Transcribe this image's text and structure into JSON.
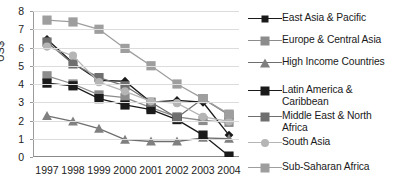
{
  "chart_data": {
    "type": "line",
    "title": "",
    "xlabel": "",
    "ylabel": "US$",
    "ylim": [
      0,
      8
    ],
    "ytick_labels": [
      "8",
      "7",
      "6",
      "5",
      "4",
      "3",
      "2",
      "1",
      "0"
    ],
    "ytick_values": [
      8,
      7,
      6,
      5,
      4,
      3,
      2,
      1,
      0
    ],
    "grid": true,
    "legend_position": "right",
    "categories": [
      "1997",
      "1998",
      "1999",
      "2000",
      "2001",
      "2002",
      "2003",
      "2004"
    ],
    "series": [
      {
        "name": "East Asia & Pacific",
        "marker": "diamond",
        "color": "#1a1a1a",
        "line_color": "#1a1a1a",
        "values": [
          6.45,
          5.15,
          4.2,
          4.15,
          3.0,
          3.1,
          3.0,
          1.2
        ]
      },
      {
        "name": "Europe & Central Asia",
        "marker": "square",
        "color": "#8c8c8c",
        "line_color": "#8c8c8c",
        "values": [
          4.45,
          4.0,
          3.4,
          3.25,
          2.7,
          2.2,
          2.0,
          1.9
        ]
      },
      {
        "name": "High Income Countries",
        "marker": "triangle",
        "color": "#808080",
        "line_color": "#6e6e6e",
        "values": [
          2.25,
          1.95,
          1.55,
          0.95,
          0.85,
          0.85,
          1.05,
          1.0
        ]
      },
      {
        "name": "Latin America & Caribbean",
        "marker": "square",
        "color": "#1a1a1a",
        "line_color": "#1a1a1a",
        "values": [
          4.05,
          3.9,
          3.2,
          2.85,
          2.6,
          2.05,
          1.2,
          0.05
        ]
      },
      {
        "name": "Middle East & North Africa",
        "marker": "square",
        "color": "#6f6f6f",
        "line_color": "#6f6f6f",
        "values": [
          6.3,
          5.1,
          4.35,
          3.9,
          3.0,
          2.15,
          3.2,
          2.3
        ]
      },
      {
        "name": "South Asia",
        "marker": "circle",
        "color": "#b5b5b5",
        "line_color": "#b5b5b5",
        "values": [
          6.05,
          5.55,
          4.1,
          3.6,
          3.05,
          2.95,
          2.2,
          1.95
        ]
      },
      {
        "name": "Sub-Saharan Africa",
        "marker": "square",
        "color": "#9e9e9e",
        "line_color": "#9e9e9e",
        "values": [
          7.5,
          7.4,
          7.0,
          5.95,
          5.0,
          4.0,
          3.2,
          2.35
        ]
      }
    ]
  },
  "axis": {
    "y_title": "US$",
    "y_labels": [
      "8",
      "7",
      "6",
      "5",
      "4",
      "3",
      "2",
      "1",
      "0"
    ],
    "x_labels": [
      "1997",
      "1998",
      "1999",
      "2000",
      "2001",
      "2002",
      "2003",
      "2004"
    ]
  },
  "legend": {
    "items": [
      {
        "label": "East Asia & Pacific",
        "marker": "diamond-marker",
        "color": "#1a1a1a",
        "line": "#1a1a1a"
      },
      {
        "label": "Europe & Central Asia",
        "marker": "square-marker",
        "color": "#8c8c8c",
        "line": "#8c8c8c"
      },
      {
        "label": "High Income Countries",
        "marker": "triangle-marker",
        "color": "#808080",
        "line": "#6e6e6e"
      },
      {
        "label": "Latin America &\nCaribbean",
        "marker": "square-marker",
        "color": "#1a1a1a",
        "line": "#1a1a1a"
      },
      {
        "label": "Middle East & North\nAfrica",
        "marker": "square-marker",
        "color": "#6f6f6f",
        "line": "#6f6f6f"
      },
      {
        "label": "South Asia",
        "marker": "circle-marker",
        "color": "#b5b5b5",
        "line": "#b5b5b5"
      },
      {
        "label": "Sub-Saharan Africa",
        "marker": "square-marker",
        "color": "#9e9e9e",
        "line": "#9e9e9e"
      }
    ]
  },
  "colors": {
    "gridline": "#dcdcdc",
    "axis": "#9a9a9a",
    "text": "#1a1a1a",
    "background": "#ffffff"
  }
}
